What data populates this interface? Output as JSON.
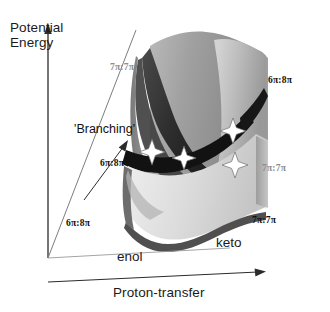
{
  "figure": {
    "kind": "3d-potential-energy-surface",
    "axes": {
      "vertical_label_line1": "Potential",
      "vertical_label_line2": "Energy",
      "horizontal_label": "Proton-transfer",
      "depth_label": "enol"
    },
    "annotations": {
      "branching": "'Branching'",
      "keto": "keto"
    },
    "state_labels": [
      {
        "text": "7π:7π",
        "tone": "grey",
        "x": 110,
        "y": 62
      },
      {
        "text": "6π:8π",
        "tone": "dark",
        "x": 268,
        "y": 75
      },
      {
        "text": "6π:8π",
        "tone": "dark",
        "x": 100,
        "y": 158
      },
      {
        "text": "7π:7π",
        "tone": "grey",
        "x": 262,
        "y": 163
      },
      {
        "text": "6π:8π",
        "tone": "dark",
        "x": 66,
        "y": 218
      },
      {
        "text": "7π:7π",
        "tone": "dark",
        "x": 252,
        "y": 215
      }
    ],
    "conical_intersections": [
      {
        "name": "star-1",
        "x": 152,
        "y": 152,
        "r": 13
      },
      {
        "name": "star-2",
        "x": 184,
        "y": 158,
        "r": 12
      },
      {
        "name": "star-3",
        "x": 233,
        "y": 131,
        "r": 13
      },
      {
        "name": "star-4",
        "x": 235,
        "y": 165,
        "r": 13
      }
    ],
    "colors": {
      "upper_sheet_light": "#c9c9c9",
      "upper_sheet_mid": "#9b9b9b",
      "upper_sheet_dark": "#6f6f6f",
      "seam_dark": "#141414",
      "wedge_dark": "#3a3a3a",
      "lower_sheet": "#d8d8d8",
      "lower_rim": "#555555",
      "axis_line": "#2b2b2b",
      "star_fill": "#ffffff",
      "star_stroke": "#6a6a6a",
      "background": "#ffffff"
    }
  }
}
